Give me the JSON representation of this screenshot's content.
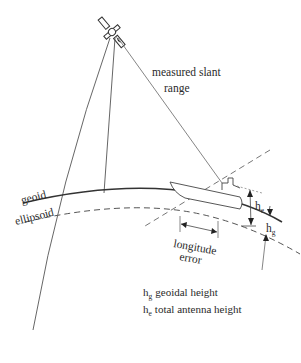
{
  "diagram": {
    "labels": {
      "slant_range_line1": "measured slant",
      "slant_range_line2": "range",
      "geoid": "geoid",
      "ellipsoid": "ellipsoid",
      "longitude_error_line1": "longitude",
      "longitude_error_line2": "error",
      "h_e_symbol": "h",
      "h_e_subscript": "e",
      "h_g_symbol": "h",
      "h_g_subscript": "g"
    },
    "legend": [
      {
        "symbol": "h",
        "subscript": "g",
        "text": "geoidal height"
      },
      {
        "symbol": "h",
        "subscript": "e",
        "text": "total antenna height"
      }
    ],
    "icons": {
      "satellite": "satellite-icon",
      "ship": "ship-icon"
    },
    "colors": {
      "line": "#333333",
      "thin_line": "#555555",
      "background": "#ffffff"
    }
  }
}
